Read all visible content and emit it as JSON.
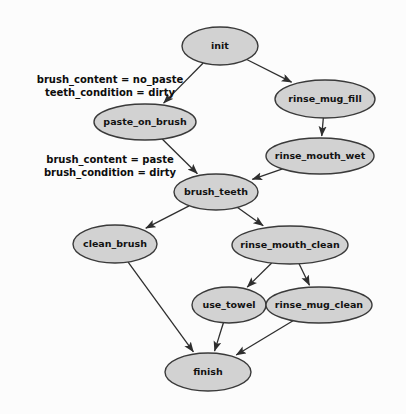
{
  "diagram": {
    "background_color": "#fcfcfc",
    "node_fill_color": "#d2d2d2",
    "node_stroke_color": "#3a3a3a",
    "edge_color": "#2e2e2e",
    "nodes": [
      {
        "id": "init",
        "label": "init",
        "cx": 220,
        "cy": 46,
        "rx": 38,
        "ry": 19
      },
      {
        "id": "rinse_mug_fill",
        "label": "rinse_mug_fill",
        "cx": 325,
        "cy": 99,
        "rx": 50,
        "ry": 19
      },
      {
        "id": "paste_on_brush",
        "label": "paste_on_brush",
        "cx": 145,
        "cy": 122,
        "rx": 51,
        "ry": 18
      },
      {
        "id": "rinse_mouth_wet",
        "label": "rinse_mouth_wet",
        "cx": 320,
        "cy": 156,
        "rx": 54,
        "ry": 18
      },
      {
        "id": "brush_teeth",
        "label": "brush_teeth",
        "cx": 216,
        "cy": 192,
        "rx": 42,
        "ry": 18
      },
      {
        "id": "clean_brush",
        "label": "clean_brush",
        "cx": 115,
        "cy": 244,
        "rx": 42,
        "ry": 19
      },
      {
        "id": "rinse_mouth_clean",
        "label": "rinse_mouth_clean",
        "cx": 290,
        "cy": 245,
        "rx": 58,
        "ry": 19
      },
      {
        "id": "use_towel",
        "label": "use_towel",
        "cx": 229,
        "cy": 305,
        "rx": 37,
        "ry": 18
      },
      {
        "id": "rinse_mug_clean",
        "label": "rinse_mug_clean",
        "cx": 319,
        "cy": 305,
        "rx": 53,
        "ry": 18
      },
      {
        "id": "finish",
        "label": "finish",
        "cx": 208,
        "cy": 372,
        "rx": 43,
        "ry": 19
      }
    ],
    "edges": [
      {
        "id": "init-paste_on_brush",
        "from": "init",
        "to": "paste_on_brush"
      },
      {
        "id": "init-rinse_mug_fill",
        "from": "init",
        "to": "rinse_mug_fill"
      },
      {
        "id": "rinse_mug_fill-rinse_mouth_wet",
        "from": "rinse_mug_fill",
        "to": "rinse_mouth_wet"
      },
      {
        "id": "paste_on_brush-brush_teeth",
        "from": "paste_on_brush",
        "to": "brush_teeth"
      },
      {
        "id": "rinse_mouth_wet-brush_teeth",
        "from": "rinse_mouth_wet",
        "to": "brush_teeth"
      },
      {
        "id": "brush_teeth-clean_brush",
        "from": "brush_teeth",
        "to": "clean_brush"
      },
      {
        "id": "brush_teeth-rinse_mouth_clean",
        "from": "brush_teeth",
        "to": "rinse_mouth_clean"
      },
      {
        "id": "rinse_mouth_clean-use_towel",
        "from": "rinse_mouth_clean",
        "to": "use_towel"
      },
      {
        "id": "rinse_mouth_clean-rinse_mug_clean",
        "from": "rinse_mouth_clean",
        "to": "rinse_mug_clean"
      },
      {
        "id": "clean_brush-finish",
        "from": "clean_brush",
        "to": "finish"
      },
      {
        "id": "use_towel-finish",
        "from": "use_towel",
        "to": "finish"
      },
      {
        "id": "rinse_mug_clean-finish",
        "from": "rinse_mug_clean",
        "to": "finish"
      }
    ],
    "edge_labels": [
      {
        "id": "label-init-paste_on_brush",
        "for_edge": "init-paste_on_brush",
        "lines": [
          "brush_content = no_paste",
          "teeth_condition = dirty"
        ],
        "x": 110,
        "y": 80
      },
      {
        "id": "label-paste_on_brush-brush_teeth",
        "for_edge": "paste_on_brush-brush_teeth",
        "lines": [
          "brush_content = paste",
          "brush_condition = dirty"
        ],
        "x": 110,
        "y": 160
      }
    ]
  }
}
